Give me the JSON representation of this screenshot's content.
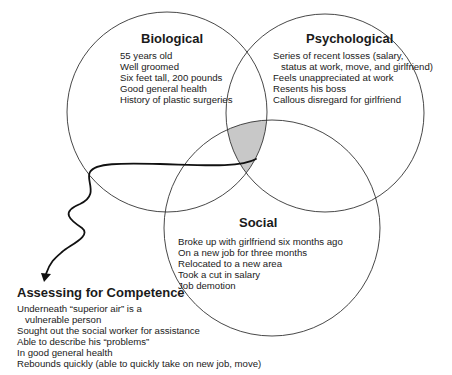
{
  "circles": {
    "biological": {
      "title": "Biological",
      "items": [
        "55 years old",
        "Well groomed",
        "Six feet tall, 200 pounds",
        "Good general health",
        "History of plastic surgeries"
      ]
    },
    "psychological": {
      "title": "Psychological",
      "items": [
        "Series of recent losses (salary,",
        "status at work, move, and girlfriend)",
        "Feels unappreciated at work",
        "Resents his boss",
        "Callous disregard for girlfriend"
      ]
    },
    "social": {
      "title": "Social",
      "items": [
        "Broke up with girlfriend six months ago",
        "On a new job for three months",
        "Relocated to a new area",
        "Took a cut in salary",
        "Job demotion"
      ]
    }
  },
  "assessment": {
    "title": "Assessing for Competence",
    "items": [
      "Underneath “superior air” is a",
      "vulnerable person",
      "Sought out the social worker for assistance",
      "Able to describe his “problems”",
      "In good general health",
      "Rebounds quickly (able to quickly take on new job, move)"
    ]
  },
  "colors": {
    "intersection_fill": "#c8c8c8",
    "stroke": "#333333"
  }
}
